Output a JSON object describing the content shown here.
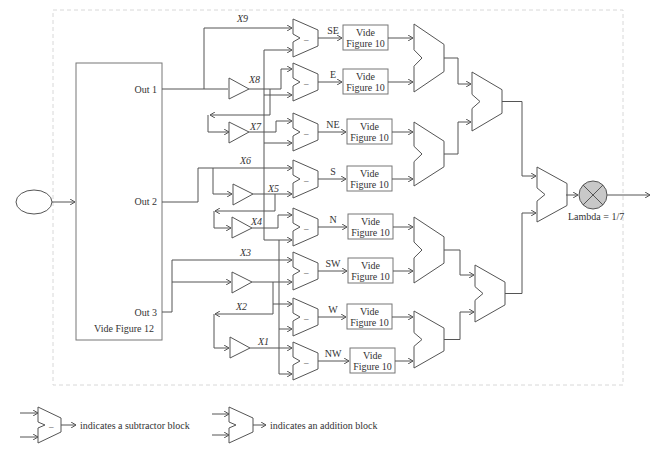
{
  "diagram": {
    "main_block": {
      "outputs": [
        "Out 1",
        "Out 2",
        "Out 3"
      ],
      "caption": "Vide Figure 12"
    },
    "gain_labels": [
      "X9",
      "X8",
      "X7",
      "X6",
      "X5",
      "X4",
      "X3",
      "X2",
      "X1"
    ],
    "directions": [
      {
        "label": "SE",
        "box_line1": "Vide",
        "box_line2": "Figure 10"
      },
      {
        "label": "E",
        "box_line1": "Vide",
        "box_line2": "Figure 10"
      },
      {
        "label": "NE",
        "box_line1": "Vide",
        "box_line2": "Figure 10"
      },
      {
        "label": "S",
        "box_line1": "Vide",
        "box_line2": "Figure 10"
      },
      {
        "label": "N",
        "box_line1": "Vide",
        "box_line2": "Figure 10"
      },
      {
        "label": "SW",
        "box_line1": "Vide",
        "box_line2": "Figure 10"
      },
      {
        "label": "W",
        "box_line1": "Vide",
        "box_line2": "Figure 10"
      },
      {
        "label": "NW",
        "box_line1": "Vide",
        "box_line2": "Figure 10"
      }
    ],
    "subtractor_symbol": "–",
    "multiplier_label": "Lambda = 1/7",
    "multiplier_color": "#c8c8c8"
  },
  "legend": {
    "subtractor_text": "indicates a subtractor block",
    "adder_text": "indicates an addition block"
  }
}
